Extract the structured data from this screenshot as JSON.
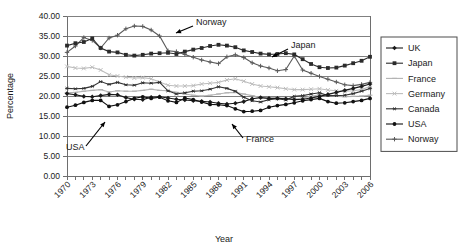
{
  "chart_data": {
    "type": "line",
    "title": "",
    "xlabel": "Year",
    "ylabel": "Percentage",
    "xlim": [
      1970,
      2006
    ],
    "ylim": [
      0,
      40
    ],
    "ytick_step": 5,
    "ytick_labels": [
      "0.00",
      "5.00",
      "10.00",
      "15.00",
      "20.00",
      "25.00",
      "30.00",
      "35.00",
      "40.00"
    ],
    "xtick_labels": [
      "1970",
      "1973",
      "1976",
      "1979",
      "1982",
      "1985",
      "1988",
      "1991",
      "1994",
      "1997",
      "2000",
      "2003",
      "2006"
    ],
    "xtick_step": 3,
    "minor_xticks": "every year",
    "grid": "horizontal",
    "legend_position": "right-outside",
    "x": [
      1970,
      1971,
      1972,
      1973,
      1974,
      1975,
      1976,
      1977,
      1978,
      1979,
      1980,
      1981,
      1982,
      1983,
      1984,
      1985,
      1986,
      1987,
      1988,
      1989,
      1990,
      1991,
      1992,
      1993,
      1994,
      1995,
      1996,
      1997,
      1998,
      1999,
      2000,
      2001,
      2002,
      2003,
      2004,
      2005,
      2006
    ],
    "series": [
      {
        "name": "UK",
        "marker": "diamond",
        "color": "#1a1a1a",
        "values": [
          20.6,
          20.3,
          19.9,
          19.8,
          20.1,
          20.4,
          20.3,
          19.6,
          19.2,
          19.1,
          19.7,
          19.8,
          19.5,
          19.2,
          19.0,
          18.8,
          18.7,
          18.5,
          18.2,
          18.0,
          18.2,
          18.6,
          19.3,
          19.6,
          19.4,
          19.4,
          19.3,
          19.1,
          19.2,
          19.5,
          19.9,
          20.4,
          20.9,
          21.4,
          21.9,
          22.4,
          23.0
        ]
      },
      {
        "name": "Japan",
        "marker": "square",
        "color": "#2b2b2b",
        "values": [
          32.6,
          33.2,
          33.5,
          34.4,
          32.0,
          31.1,
          30.9,
          30.3,
          30.1,
          30.3,
          30.6,
          30.7,
          30.8,
          30.5,
          31.1,
          31.6,
          32.0,
          32.5,
          32.8,
          32.6,
          32.2,
          31.4,
          31.0,
          30.6,
          30.4,
          30.5,
          30.7,
          30.4,
          29.2,
          28.0,
          27.2,
          27.0,
          27.1,
          27.6,
          28.2,
          28.8,
          29.8
        ]
      },
      {
        "name": "France",
        "marker": "dash",
        "color": "#b3b3b3",
        "values": [
          20.8,
          20.9,
          21.2,
          21.4,
          21.6,
          21.0,
          21.3,
          21.2,
          21.2,
          21.4,
          21.7,
          21.4,
          21.3,
          20.9,
          20.5,
          20.2,
          20.0,
          20.2,
          20.5,
          20.8,
          20.9,
          20.5,
          20.1,
          19.6,
          19.4,
          19.5,
          19.4,
          19.2,
          19.5,
          19.9,
          20.3,
          20.1,
          19.9,
          19.8,
          19.9,
          20.0,
          20.2
        ]
      },
      {
        "name": "Germany",
        "marker": "x",
        "color": "#bdbdbd",
        "values": [
          27.4,
          27.0,
          26.9,
          27.2,
          26.5,
          25.3,
          25.0,
          24.7,
          24.5,
          24.6,
          24.3,
          23.5,
          22.7,
          22.5,
          22.5,
          22.6,
          23.0,
          23.2,
          23.4,
          24.0,
          24.3,
          23.7,
          23.0,
          22.5,
          22.3,
          22.1,
          21.8,
          21.6,
          21.6,
          21.7,
          21.8,
          21.5,
          21.3,
          21.2,
          21.3,
          21.6,
          22.4
        ]
      },
      {
        "name": "Canada",
        "marker": "asterisk",
        "color": "#333333",
        "values": [
          21.9,
          21.8,
          21.9,
          22.4,
          23.6,
          22.9,
          23.4,
          22.8,
          22.7,
          23.3,
          23.2,
          23.4,
          21.3,
          20.5,
          20.8,
          21.2,
          21.3,
          21.7,
          22.3,
          21.9,
          21.2,
          19.7,
          18.8,
          18.5,
          19.1,
          19.3,
          19.0,
          19.9,
          20.1,
          20.5,
          20.8,
          20.1,
          20.1,
          20.2,
          20.6,
          21.2,
          21.9
        ]
      },
      {
        "name": "USA",
        "marker": "circle",
        "color": "#111111",
        "values": [
          17.2,
          17.7,
          18.4,
          18.9,
          18.9,
          17.4,
          17.8,
          18.6,
          19.4,
          19.8,
          19.4,
          19.7,
          18.8,
          18.4,
          19.5,
          19.1,
          18.5,
          17.9,
          17.8,
          17.6,
          16.8,
          16.1,
          16.2,
          16.4,
          17.2,
          17.6,
          17.9,
          18.3,
          18.8,
          19.1,
          19.4,
          18.6,
          18.2,
          18.3,
          18.6,
          18.9,
          19.4
        ]
      },
      {
        "name": "Norway",
        "marker": "plus",
        "color": "#5a5a5a",
        "values": [
          30.9,
          32.5,
          34.6,
          33.9,
          32.0,
          34.5,
          35.2,
          36.8,
          37.5,
          37.4,
          36.5,
          35.0,
          31.3,
          31.1,
          30.4,
          29.7,
          29.0,
          28.5,
          28.1,
          29.8,
          30.3,
          29.6,
          28.3,
          27.5,
          27.0,
          26.3,
          26.6,
          30.0,
          26.5,
          25.7,
          24.9,
          24.2,
          23.5,
          22.8,
          22.6,
          22.9,
          23.4
        ]
      }
    ],
    "annotations": [
      {
        "text": "Norway",
        "series": "Norway"
      },
      {
        "text": "Japan",
        "series": "Japan"
      },
      {
        "text": "USA",
        "series": "USA"
      },
      {
        "text": "France",
        "series": "France"
      }
    ]
  },
  "legend": {
    "entries": [
      {
        "label": "UK"
      },
      {
        "label": "Japan"
      },
      {
        "label": "France"
      },
      {
        "label": "Germany"
      },
      {
        "label": "Canada"
      },
      {
        "label": "USA"
      },
      {
        "label": "Norway"
      }
    ]
  }
}
